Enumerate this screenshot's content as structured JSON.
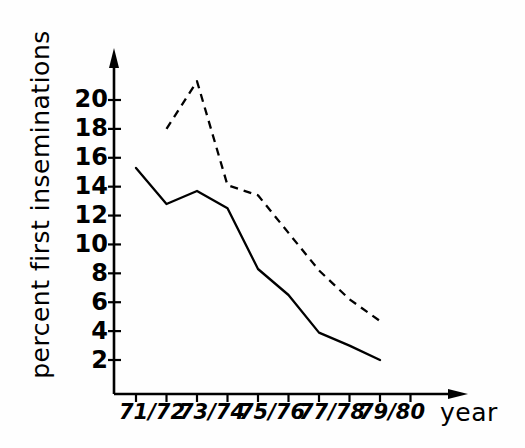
{
  "chart_data": {
    "type": "line",
    "title": "",
    "xlabel": "year",
    "ylabel": "percent first inseminations",
    "categories": [
      "71/72",
      "72/73",
      "73/74",
      "74/75",
      "75/76",
      "76/77",
      "77/78",
      "78/79",
      "79/80"
    ],
    "x_tick_labels": [
      "71/72",
      "73/74",
      "75/76",
      "77/78",
      "79/80"
    ],
    "y_tick_labels": [
      "2",
      "4",
      "6",
      "8",
      "10",
      "12",
      "14",
      "16",
      "18",
      "20"
    ],
    "y_tick_values": [
      2,
      4,
      6,
      8,
      10,
      12,
      14,
      16,
      18,
      20
    ],
    "ylim": [
      0,
      21.8
    ],
    "grid": false,
    "legend": "none",
    "series": [
      {
        "name": "solid-series",
        "style": "solid",
        "color": "#000000",
        "x": [
          "71/72",
          "72/73",
          "73/74",
          "74/75",
          "75/76",
          "76/77",
          "77/78",
          "78/79",
          "79/80"
        ],
        "values": [
          15.3,
          12.8,
          13.7,
          12.5,
          8.3,
          6.5,
          3.9,
          3.0,
          2.0
        ]
      },
      {
        "name": "dashed-series",
        "style": "dashed",
        "color": "#000000",
        "x": [
          "72/73",
          "73/74",
          "74/75",
          "75/76",
          "76/77",
          "77/78",
          "78/79",
          "79/80"
        ],
        "values": [
          18.0,
          21.3,
          14.1,
          13.4,
          10.8,
          8.2,
          6.2,
          4.7
        ]
      }
    ]
  },
  "axes": {
    "y_axis_name": "y-axis",
    "x_axis_name": "x-axis",
    "arrow_y": "up-arrow",
    "arrow_x": "right-arrow"
  }
}
